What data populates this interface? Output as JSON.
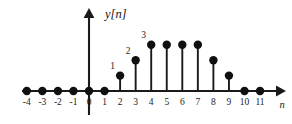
{
  "figure": {
    "y_axis_label": "y[n]",
    "x_axis_label": "n",
    "background_color": "#ffffff",
    "ink_color": "#1a1a1a"
  },
  "chart_data": {
    "type": "stem",
    "title": "",
    "subtitle": "",
    "xlabel": "n",
    "ylabel": "y[n]",
    "x": [
      -4,
      -3,
      -2,
      -1,
      0,
      1,
      2,
      3,
      4,
      5,
      6,
      7,
      8,
      9,
      10,
      11
    ],
    "values": [
      0,
      0,
      0,
      0,
      0,
      0,
      1,
      2,
      3,
      3,
      3,
      3,
      2,
      1,
      0,
      0
    ],
    "tick_labels": [
      "-4",
      "-3",
      "-2",
      "-1",
      "0",
      "1",
      "2",
      "3",
      "4",
      "5",
      "6",
      "7",
      "8",
      "9",
      "10",
      "11"
    ],
    "point_annotations": [
      {
        "x": 2,
        "label": "1"
      },
      {
        "x": 3,
        "label": "2"
      },
      {
        "x": 4,
        "label": "3"
      }
    ],
    "xlim": [
      -4,
      11
    ],
    "ylim": [
      0,
      3
    ],
    "grid": false,
    "legend": null,
    "marker": "filled-circle",
    "series_name": "y[n]"
  }
}
